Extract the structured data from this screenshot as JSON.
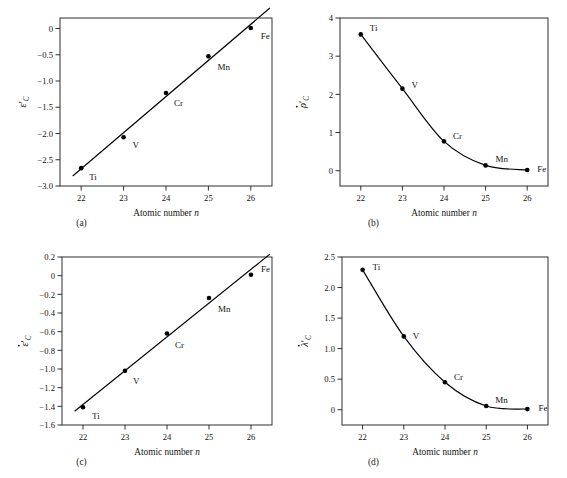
{
  "figure": {
    "background": "#ffffff",
    "line_color": "#000000",
    "marker_color": "#000000",
    "axis_color": "#1a1a1a"
  },
  "common": {
    "xlabel_text": "Atomic number ",
    "xlabel_italic": "n",
    "element_labels": [
      "Ti",
      "V",
      "Cr",
      "Mn",
      "Fe"
    ],
    "xticks": [
      "22",
      "23",
      "24",
      "25",
      "26"
    ]
  },
  "chart_data": [
    {
      "type": "scatter",
      "panel": "a",
      "caption": "(a)",
      "title": "",
      "xlabel": "Atomic number n",
      "ylabel": "ε'_C",
      "ylabel_glyph": "ε",
      "ylabel_prime": "′",
      "ylabel_sub": "C",
      "ylabel_dot": false,
      "x": [
        22,
        23,
        24,
        25,
        26
      ],
      "values": [
        -2.66,
        -2.07,
        -1.23,
        -0.53,
        0.01
      ],
      "point_labels": [
        "Ti",
        "V",
        "Cr",
        "Mn",
        "Fe"
      ],
      "xlim": [
        21.5,
        26.5
      ],
      "ylim": [
        -3.0,
        0.2
      ],
      "yticks": [
        "0",
        "−0.5",
        "−1.0",
        "−1.5",
        "−2.0",
        "−2.5",
        "−3.0"
      ],
      "ytick_values": [
        0,
        -0.5,
        -1.0,
        -1.5,
        -2.0,
        -2.5,
        -3.0
      ],
      "xticks": [
        "22",
        "23",
        "24",
        "25",
        "26"
      ],
      "fit": "linear",
      "grid": false,
      "legend": "none"
    },
    {
      "type": "scatter",
      "panel": "b",
      "caption": "(b)",
      "title": "",
      "xlabel": "Atomic number n",
      "ylabel": "ρ̇'_C",
      "ylabel_glyph": "ρ",
      "ylabel_prime": "′",
      "ylabel_sub": "C",
      "ylabel_dot": true,
      "x": [
        22,
        23,
        24,
        25,
        26
      ],
      "values": [
        3.57,
        2.15,
        0.77,
        0.14,
        0.02
      ],
      "point_labels": [
        "Ti",
        "V",
        "Cr",
        "Mn",
        "Fe"
      ],
      "xlim": [
        21.5,
        26.5
      ],
      "ylim": [
        -0.4,
        4.0
      ],
      "yticks": [
        "4",
        "3",
        "2",
        "1",
        "0"
      ],
      "ytick_values": [
        4,
        3,
        2,
        1,
        0
      ],
      "xticks": [
        "22",
        "23",
        "24",
        "25",
        "26"
      ],
      "fit": "curve",
      "grid": false,
      "legend": "none"
    },
    {
      "type": "scatter",
      "panel": "c",
      "caption": "(c)",
      "title": "",
      "xlabel": "Atomic number n",
      "ylabel": "ε̇'_C",
      "ylabel_glyph": "ε",
      "ylabel_prime": "′",
      "ylabel_sub": "C",
      "ylabel_dot": true,
      "x": [
        22,
        23,
        24,
        25,
        26
      ],
      "values": [
        -1.41,
        -1.02,
        -0.62,
        -0.24,
        0.01
      ],
      "point_labels": [
        "Ti",
        "V",
        "Cr",
        "Mn",
        "Fe"
      ],
      "xlim": [
        21.5,
        26.5
      ],
      "ylim": [
        -1.6,
        0.2
      ],
      "yticks": [
        "0.2",
        "0",
        "−0.2",
        "−0.4",
        "−0.6",
        "−0.8",
        "−1.0",
        "−1.2",
        "−1.4",
        "−1.6"
      ],
      "ytick_values": [
        0.2,
        0,
        -0.2,
        -0.4,
        -0.6,
        -0.8,
        -1.0,
        -1.2,
        -1.4,
        -1.6
      ],
      "xticks": [
        "22",
        "23",
        "24",
        "25",
        "26"
      ],
      "fit": "linear",
      "grid": false,
      "legend": "none"
    },
    {
      "type": "scatter",
      "panel": "d",
      "caption": "(d)",
      "title": "",
      "xlabel": "Atomic number n",
      "ylabel": "λ̇'_C",
      "ylabel_glyph": "λ",
      "ylabel_prime": "′",
      "ylabel_sub": "C",
      "ylabel_dot": true,
      "x": [
        22,
        23,
        24,
        25,
        26
      ],
      "values": [
        2.29,
        1.2,
        0.45,
        0.06,
        0.01
      ],
      "point_labels": [
        "Ti",
        "V",
        "Cr",
        "Mn",
        "Fe"
      ],
      "xlim": [
        21.5,
        26.5
      ],
      "ylim": [
        -0.25,
        2.5
      ],
      "yticks": [
        "2.5",
        "2.0",
        "1.5",
        "1.0",
        "0.5",
        "0"
      ],
      "ytick_values": [
        2.5,
        2.0,
        1.5,
        1.0,
        0.5,
        0
      ],
      "xticks": [
        "22",
        "23",
        "24",
        "25",
        "26"
      ],
      "fit": "curve",
      "grid": false,
      "legend": "none"
    }
  ]
}
